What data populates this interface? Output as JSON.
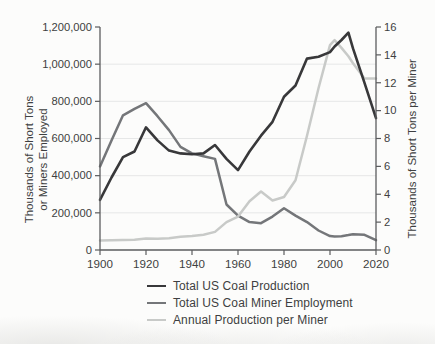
{
  "chart_data": {
    "type": "line",
    "x_years": [
      1900,
      1905,
      1910,
      1915,
      1920,
      1925,
      1930,
      1935,
      1940,
      1945,
      1950,
      1955,
      1960,
      1965,
      1970,
      1975,
      1980,
      1985,
      1990,
      1995,
      2000,
      2002,
      2005,
      2008,
      2010,
      2015,
      2020
    ],
    "series": [
      {
        "name": "Total US Coal Production",
        "axis": "left",
        "color": "#38383a",
        "stroke_width": 2.6,
        "values": [
          270000,
          390000,
          500000,
          530000,
          660000,
          590000,
          535000,
          520000,
          515000,
          520000,
          565000,
          490000,
          430000,
          530000,
          615000,
          690000,
          825000,
          885000,
          1030000,
          1040000,
          1065000,
          1095000,
          1130000,
          1170000,
          1085000,
          900000,
          710000
        ]
      },
      {
        "name": "Total US Coal Miner Employment",
        "axis": "left",
        "color": "#747679",
        "stroke_width": 2.5,
        "values": [
          450000,
          590000,
          725000,
          760000,
          790000,
          720000,
          645000,
          555000,
          520000,
          505000,
          490000,
          245000,
          185000,
          150000,
          144000,
          180000,
          225000,
          185000,
          150000,
          105000,
          75000,
          73000,
          74000,
          80000,
          85000,
          82000,
          53000
        ]
      },
      {
        "name": "Annual Production per Miner",
        "axis": "right",
        "color": "#c8cac8",
        "stroke_width": 2.5,
        "values": [
          0.68,
          0.7,
          0.72,
          0.73,
          0.82,
          0.8,
          0.85,
          0.95,
          1.0,
          1.1,
          1.3,
          2.0,
          2.4,
          3.5,
          4.2,
          3.55,
          3.8,
          5.0,
          8.2,
          11.6,
          14.7,
          15.05,
          14.5,
          13.9,
          13.4,
          12.3,
          12.3
        ]
      }
    ],
    "left_axis": {
      "title_lines": [
        "Thousands of Short Tons",
        "or Miners Employed"
      ],
      "min": 0,
      "max": 1200000,
      "ticks": [
        0,
        200000,
        400000,
        600000,
        800000,
        1000000,
        1200000
      ],
      "tick_labels": [
        "0",
        "200,000",
        "400,000",
        "600,000",
        "800,000",
        "1,000,000",
        "1,200,000"
      ]
    },
    "right_axis": {
      "title": "Thousands of Short Tons per Miner",
      "min": 0,
      "max": 16,
      "ticks": [
        0,
        2,
        4,
        6,
        8,
        10,
        12,
        14,
        16
      ],
      "tick_labels": [
        "0",
        "2",
        "4",
        "6",
        "8",
        "10",
        "12",
        "14",
        "16"
      ]
    },
    "x_axis": {
      "min": 1900,
      "max": 2020,
      "ticks": [
        1900,
        1920,
        1940,
        1960,
        1980,
        2000,
        2020
      ],
      "tick_labels": [
        "1900",
        "1920",
        "1940",
        "1960",
        "1980",
        "2000",
        "2020"
      ]
    },
    "grid": "horizontal",
    "legend_position": "bottom"
  },
  "styles": {
    "grid_color": "#e6e7e7",
    "axis_color": "#5b5c5e",
    "text_color": "#3e3f41",
    "background": "#fcfcfb"
  }
}
